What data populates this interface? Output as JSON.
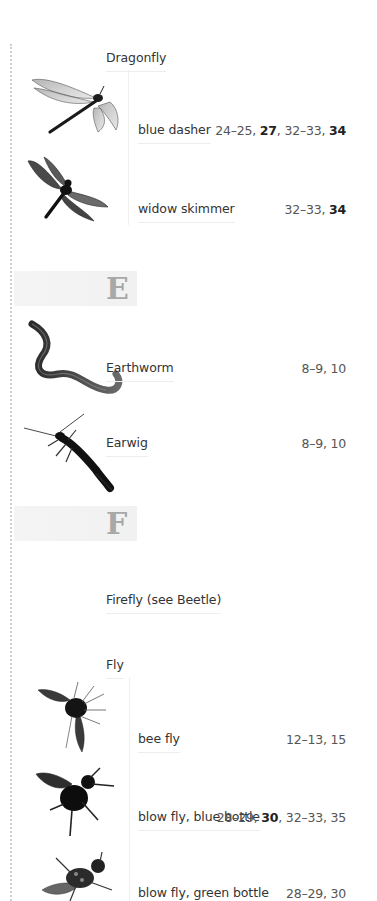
{
  "sections": {
    "D": {
      "entries": [
        {
          "label": "Dragonfly",
          "subentries": [
            {
              "label": "blue dasher",
              "pages": [
                {
                  "t": "24–25, "
                },
                {
                  "t": "27",
                  "b": true
                },
                {
                  "t": ", 32–33, "
                },
                {
                  "t": "34",
                  "b": true
                }
              ],
              "image": "dragonfly-blue-dasher-photo"
            },
            {
              "label": "widow skimmer",
              "pages": [
                {
                  "t": "32–33, "
                },
                {
                  "t": "34",
                  "b": true
                }
              ],
              "image": "dragonfly-widow-skimmer-photo"
            }
          ]
        }
      ]
    },
    "E": {
      "letter": "E",
      "entries": [
        {
          "label": "Earthworm",
          "pages": [
            {
              "t": "8–9, 10"
            }
          ],
          "image": "earthworm-photo"
        },
        {
          "label": "Earwig",
          "pages": [
            {
              "t": "8–9, 10"
            }
          ],
          "image": "earwig-photo"
        }
      ]
    },
    "F": {
      "letter": "F",
      "entries": [
        {
          "label": "Firefly (see Beetle)"
        },
        {
          "label": "Fly",
          "subentries": [
            {
              "label": "bee fly",
              "pages": [
                {
                  "t": "12–13, 15"
                }
              ],
              "image": "bee-fly-photo"
            },
            {
              "label": "blow fly, blue bottle",
              "pages": [
                {
                  "t": "28–29, "
                },
                {
                  "t": "30",
                  "b": true
                },
                {
                  "t": ", 32–33, 35"
                }
              ],
              "image": "blue-bottle-fly-photo"
            },
            {
              "label": "blow fly, green bottle",
              "pages": [
                {
                  "t": "28–29, 30"
                }
              ],
              "image": "green-bottle-fly-photo"
            }
          ]
        }
      ]
    }
  },
  "flat_pages": {
    "blue_dasher": [
      "24–25, ",
      "27",
      ", 32–33, ",
      "34"
    ],
    "widow_skimmer": [
      "32–33, ",
      "34"
    ],
    "earthworm": [
      "8–9, 10"
    ],
    "earwig": [
      "8–9, 10"
    ],
    "bee_fly": [
      "12–13, 15"
    ],
    "blue_bottle": [
      "28–29, ",
      "30",
      ", 32–33, 35"
    ],
    "green_bottle": [
      "28–29, 30"
    ]
  }
}
